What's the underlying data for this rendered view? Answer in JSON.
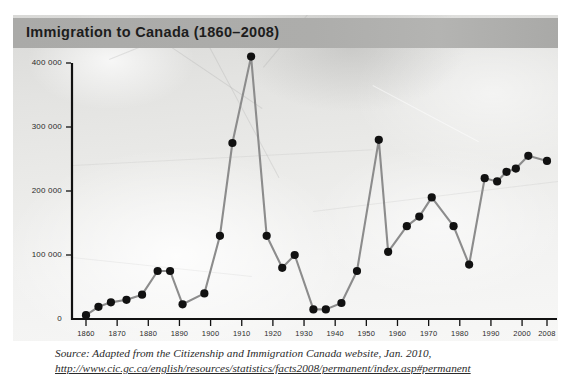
{
  "chart_data": {
    "type": "line",
    "title": "Immigration to Canada (1860–2008)",
    "xlabel": "",
    "ylabel": "",
    "xlim": [
      1858,
      2010
    ],
    "ylim": [
      0,
      420000
    ],
    "grid": false,
    "legend": "none",
    "marker": "filled-circle",
    "line_color": "#8c8c8c",
    "marker_color": "#111111",
    "y_ticks": [
      0,
      100000,
      200000,
      300000,
      400000
    ],
    "y_tick_labels": [
      "0",
      "100 000",
      "200 000",
      "300 000",
      "400 000"
    ],
    "x_ticks": [
      1860,
      1870,
      1880,
      1890,
      1900,
      1910,
      1920,
      1930,
      1940,
      1950,
      1960,
      1970,
      1980,
      1990,
      2000,
      2008
    ],
    "x_tick_labels": [
      "1860",
      "1870",
      "1880",
      "1890",
      "1900",
      "1910",
      "1920",
      "1930",
      "1940",
      "1950",
      "1960",
      "1970",
      "1980",
      "1990",
      "2000",
      "2008"
    ],
    "x": [
      1860,
      1864,
      1868,
      1873,
      1878,
      1883,
      1887,
      1891,
      1898,
      1903,
      1907,
      1913,
      1918,
      1923,
      1927,
      1933,
      1937,
      1942,
      1947,
      1954,
      1957,
      1963,
      1967,
      1971,
      1978,
      1983,
      1988,
      1992,
      1995,
      1998,
      2002,
      2008
    ],
    "y": [
      6000,
      19000,
      26000,
      30000,
      38000,
      75000,
      75000,
      23000,
      40000,
      130000,
      275000,
      410000,
      130000,
      80000,
      100000,
      15000,
      15000,
      25000,
      75000,
      280000,
      105000,
      145000,
      160000,
      190000,
      145000,
      85000,
      220000,
      215000,
      230000,
      235000,
      255000,
      247000
    ],
    "series": [
      {
        "name": "Immigrants admitted to Canada",
        "points": [
          {
            "year": 1860,
            "value": 6000
          },
          {
            "year": 1864,
            "value": 19000
          },
          {
            "year": 1868,
            "value": 26000
          },
          {
            "year": 1873,
            "value": 30000
          },
          {
            "year": 1878,
            "value": 38000
          },
          {
            "year": 1883,
            "value": 75000
          },
          {
            "year": 1887,
            "value": 75000
          },
          {
            "year": 1891,
            "value": 23000
          },
          {
            "year": 1898,
            "value": 40000
          },
          {
            "year": 1903,
            "value": 130000
          },
          {
            "year": 1907,
            "value": 275000
          },
          {
            "year": 1913,
            "value": 410000
          },
          {
            "year": 1918,
            "value": 130000
          },
          {
            "year": 1923,
            "value": 80000
          },
          {
            "year": 1927,
            "value": 100000
          },
          {
            "year": 1933,
            "value": 15000
          },
          {
            "year": 1937,
            "value": 15000
          },
          {
            "year": 1942,
            "value": 25000
          },
          {
            "year": 1947,
            "value": 75000
          },
          {
            "year": 1954,
            "value": 280000
          },
          {
            "year": 1957,
            "value": 105000
          },
          {
            "year": 1963,
            "value": 145000
          },
          {
            "year": 1967,
            "value": 160000
          },
          {
            "year": 1971,
            "value": 190000
          },
          {
            "year": 1978,
            "value": 145000
          },
          {
            "year": 1983,
            "value": 85000
          },
          {
            "year": 1988,
            "value": 220000
          },
          {
            "year": 1992,
            "value": 215000
          },
          {
            "year": 1995,
            "value": 230000
          },
          {
            "year": 1998,
            "value": 235000
          },
          {
            "year": 2002,
            "value": 255000
          },
          {
            "year": 2008,
            "value": 247000
          }
        ]
      }
    ]
  },
  "title": {
    "text": "Immigration to Canada (1860–2008)",
    "band_color": "#adadab",
    "text_color": "#1d1d1d"
  },
  "panel": {
    "background_color": "#e9e9e7",
    "description": "faded photographic backdrop"
  },
  "source": {
    "line1": "Source: Adapted from the Citizenship and Immigration Canada website, Jan. 2010,",
    "url": "http://www.cic.gc.ca/english/resources/statistics/facts2008/permanent/index.asp#permanent"
  }
}
